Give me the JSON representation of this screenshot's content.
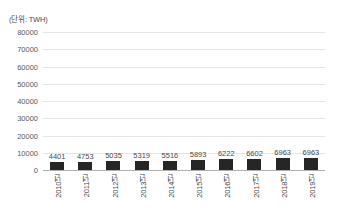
{
  "chart_data": {
    "type": "bar",
    "title": "",
    "subtitle": "",
    "unit_label": "(단위: TWH)",
    "xlabel": "",
    "ylabel": "",
    "categories": [
      "2010년",
      "2011년",
      "2012년",
      "2013년",
      "2014년",
      "2015년",
      "2016년",
      "2017년",
      "2018년",
      "2019년"
    ],
    "values": [
      4401,
      4753,
      5035,
      5319,
      5516,
      5893,
      6222,
      6602,
      6963,
      6963
    ],
    "value_labels": [
      "4401",
      "4753",
      "5035",
      "5319",
      "5516",
      "5893",
      "6222",
      "6602",
      "6963",
      "6963"
    ],
    "ylim": [
      0,
      80000
    ],
    "yticks": [
      0,
      10000,
      20000,
      30000,
      40000,
      50000,
      60000,
      70000,
      80000
    ],
    "ytick_labels": [
      "0",
      "10000",
      "20000",
      "30000",
      "40000",
      "50000",
      "60000",
      "70000",
      "80000"
    ],
    "grid": true,
    "legend": "none",
    "bar_color": "#262626",
    "grid_color": "#e6e6e6",
    "axis_color": "#b0b0b0",
    "background_color": "#ffffff",
    "text_color": "#4a4a4a"
  }
}
